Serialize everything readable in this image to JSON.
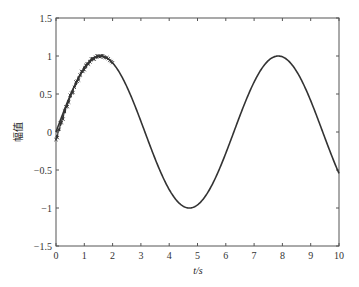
{
  "chart_data": {
    "type": "line",
    "title": "",
    "xlabel": "t/s",
    "ylabel": "幅值",
    "xlim": [
      0,
      10
    ],
    "ylim": [
      -1.5,
      1.5
    ],
    "xticks": [
      0,
      1,
      2,
      3,
      4,
      5,
      6,
      7,
      8,
      9,
      10
    ],
    "xtick_labels": [
      "0",
      "1",
      "2",
      "3",
      "4",
      "5",
      "6",
      "7",
      "8",
      "9",
      "10"
    ],
    "yticks": [
      -1.5,
      -1,
      -0.5,
      0,
      0.5,
      1,
      1.5
    ],
    "ytick_labels": [
      "-1.5",
      "-1",
      "-0.5",
      "0",
      "0.5",
      "1",
      "1.5"
    ],
    "grid": false,
    "legend": null,
    "series": [
      {
        "name": "reference",
        "style": "solid",
        "color": "#333333",
        "function": "sin(t)",
        "x": [
          0,
          0.5,
          1,
          1.5,
          1.57,
          2,
          2.5,
          3,
          3.5,
          4,
          4.5,
          4.71,
          5,
          5.5,
          6,
          6.5,
          7,
          7.5,
          7.85,
          8,
          8.5,
          9,
          9.5,
          10
        ],
        "values": [
          0,
          0.48,
          0.84,
          1.0,
          1.0,
          0.91,
          0.6,
          0.14,
          -0.35,
          -0.76,
          -0.98,
          -1.0,
          -0.96,
          -0.71,
          -0.28,
          0.22,
          0.66,
          0.94,
          1.0,
          0.99,
          0.8,
          0.41,
          -0.08,
          -0.54
        ]
      },
      {
        "name": "tracking",
        "style": "marker-x",
        "color": "#333333",
        "note": "jagged transient overlapping reference from t=0 to ~2, starting near -0.1",
        "x": [
          0,
          0.2,
          0.4,
          0.6,
          0.8,
          1.0,
          1.2,
          1.4,
          1.6,
          1.8,
          2.0
        ],
        "values": [
          -0.1,
          0.18,
          0.36,
          0.58,
          0.7,
          0.85,
          0.92,
          0.99,
          1.01,
          0.97,
          0.91
        ]
      }
    ]
  }
}
